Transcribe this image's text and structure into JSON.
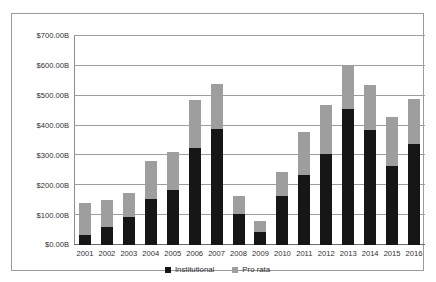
{
  "chart_data": {
    "type": "bar",
    "stacked": true,
    "title": "",
    "subtitle": "",
    "xlabel": "",
    "ylabel": "",
    "ylim": [
      0,
      700
    ],
    "ytick_step": 100,
    "grid": true,
    "legend_position": "bottom-center",
    "value_unit": "B",
    "value_prefix": "$",
    "categories": [
      "2001",
      "2002",
      "2003",
      "2004",
      "2005",
      "2006",
      "2007",
      "2008",
      "2009",
      "2010",
      "2011",
      "2012",
      "2013",
      "2014",
      "2015",
      "2016"
    ],
    "ytick_labels": [
      "$0.00B",
      "$100.00B",
      "$200.00B",
      "$300.00B",
      "$400.00B",
      "$500.00B",
      "$600.00B",
      "$700.00B"
    ],
    "ytick_values": [
      0,
      100,
      200,
      300,
      400,
      500,
      600,
      700
    ],
    "series": [
      {
        "name": "Institutional",
        "color": "#161616",
        "values": [
          35,
          60,
          95,
          155,
          185,
          325,
          390,
          105,
          45,
          165,
          235,
          305,
          455,
          385,
          265,
          340
        ]
      },
      {
        "name": "Pro rata",
        "color": "#9e9e9e",
        "values": [
          105,
          90,
          80,
          125,
          125,
          160,
          150,
          60,
          35,
          80,
          145,
          165,
          145,
          150,
          165,
          150
        ]
      }
    ],
    "totals": [
      140,
      150,
      175,
      280,
      310,
      485,
      540,
      165,
      80,
      245,
      380,
      470,
      600,
      535,
      430,
      490
    ]
  },
  "legend": {
    "items": [
      {
        "label": "Institutional",
        "icon": "square-swatch-icon"
      },
      {
        "label": "Pro rata",
        "icon": "square-swatch-icon"
      }
    ]
  }
}
